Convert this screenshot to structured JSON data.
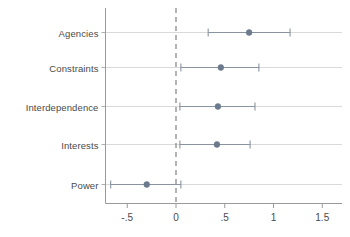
{
  "chart_data": {
    "type": "scatter",
    "title": "",
    "subtitle": "",
    "xlabel": "",
    "ylabel": "",
    "orientation": "horizontal",
    "grid": true,
    "legend": null,
    "xlim": [
      -0.72,
      1.57
    ],
    "xticks": [
      -0.5,
      0,
      0.5,
      1,
      1.5
    ],
    "xticklabels": [
      "-.5",
      "0",
      ".5",
      "1",
      "1.5"
    ],
    "categories": [
      "Agencies",
      "Constraints",
      "Interdependence",
      "Interests",
      "Power"
    ],
    "reference_line": {
      "value": 0,
      "style": "dashed",
      "color": "#8a8a8a"
    },
    "point_color": "#6b7a8c",
    "line_color": "#8a93a0",
    "axis_color": "#9a9a9a",
    "grid_color": "#c8c8c8",
    "text_color": "#4a4a4a",
    "points": [
      {
        "label": "Agencies",
        "estimate": 0.75,
        "ci_low": 0.33,
        "ci_high": 1.17
      },
      {
        "label": "Constraints",
        "estimate": 0.46,
        "ci_low": 0.05,
        "ci_high": 0.85
      },
      {
        "label": "Interdependence",
        "estimate": 0.43,
        "ci_low": 0.04,
        "ci_high": 0.81
      },
      {
        "label": "Interests",
        "estimate": 0.42,
        "ci_low": 0.04,
        "ci_high": 0.76
      },
      {
        "label": "Power",
        "estimate": -0.3,
        "ci_low": -0.67,
        "ci_high": 0.05
      }
    ]
  }
}
